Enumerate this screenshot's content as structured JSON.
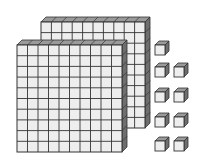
{
  "diagram": {
    "type": "base-ten-blocks",
    "flats": {
      "count": 2,
      "grid": 10,
      "value_each": 100
    },
    "units": {
      "count": 9,
      "value_each": 1,
      "layout_rows": [
        1,
        2,
        2,
        2,
        2
      ]
    },
    "represented_value": 209,
    "colors": {
      "face": "#eeeeee",
      "top": "#9a9a9a",
      "side": "#6e6e6e",
      "line": "#333333"
    }
  }
}
